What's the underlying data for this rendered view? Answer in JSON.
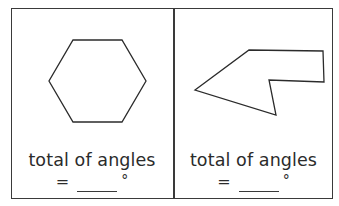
{
  "panels": [
    {
      "shape": "hexagon",
      "caption": "total of angles",
      "equals": "=",
      "blank": "",
      "unit": "°"
    },
    {
      "shape": "irregular-hexagon-concave",
      "caption": "total of angles",
      "equals": "=",
      "blank": "",
      "unit": "°"
    }
  ],
  "colors": {
    "stroke": "#2b2b2b",
    "background": "#ffffff"
  }
}
